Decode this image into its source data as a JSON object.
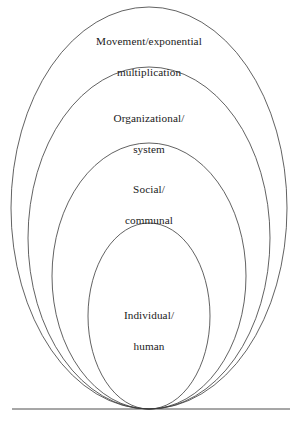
{
  "diagram": {
    "type": "nested-ellipses",
    "background_color": "#ffffff",
    "stroke_color": "#3a3a3a",
    "text_color": "#1a1a1a",
    "baseline": {
      "name": "baseline",
      "y": 409,
      "x_start": 12,
      "x_end": 290
    },
    "rings": [
      {
        "id": "movement",
        "label_line1": "Movement/exponential",
        "label_line2": "multiplication",
        "cx": 149,
        "cy": 208,
        "rx": 138,
        "ry": 201
      },
      {
        "id": "organizational",
        "label_line1": "Organizational/",
        "label_line2": "system",
        "cx": 149,
        "cy": 238,
        "rx": 121,
        "ry": 171
      },
      {
        "id": "social",
        "label_line1": "Social/",
        "label_line2": "communal",
        "cx": 149,
        "cy": 276,
        "rx": 97,
        "ry": 133
      },
      {
        "id": "individual",
        "label_line1": "Individual/",
        "label_line2": "human",
        "cx": 149,
        "cy": 316,
        "rx": 61,
        "ry": 93
      }
    ]
  }
}
